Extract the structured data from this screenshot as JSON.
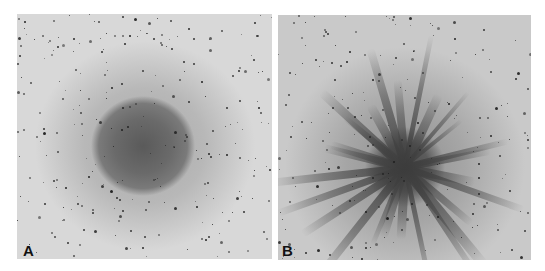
{
  "figure": {
    "panels": [
      {
        "id": "A",
        "label": "A",
        "description": "diffuse dark circular blob centered in a speckled light-gray field"
      },
      {
        "id": "B",
        "label": "B",
        "description": "dendritic radial branching pattern spreading from center in a speckled gray field"
      }
    ],
    "colors": {
      "background": "#ffffff",
      "field_light": "#d8d8d8",
      "blob_dark": "#5a5a5a",
      "branch_dark": "#4a4a4a",
      "speckle": "#1e1e1e",
      "label": "#111111"
    }
  }
}
